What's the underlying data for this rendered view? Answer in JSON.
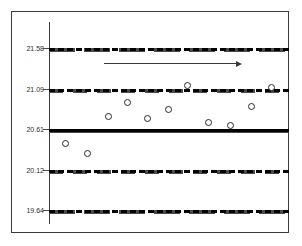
{
  "chart_data": {
    "type": "scatter",
    "title": "",
    "subtitle": "",
    "xlabel": "",
    "ylabel": "",
    "grid": false,
    "legend": null,
    "ylim": [
      19.64,
      21.58
    ],
    "ytick_labels": [
      "21.58",
      "21.09",
      "20.61",
      "20.12",
      "19.64"
    ],
    "ytick_values": [
      21.58,
      21.09,
      20.61,
      20.12,
      19.64
    ],
    "reference_lines": [
      {
        "name": "upper-control-limit",
        "value": 21.58,
        "style": "dash-long",
        "label": "21.58"
      },
      {
        "name": "upper-warning-limit",
        "value": 21.09,
        "style": "dash-short",
        "label": "21.09"
      },
      {
        "name": "center-line",
        "value": 20.61,
        "style": "solid",
        "label": "20.61"
      },
      {
        "name": "lower-warning-limit",
        "value": 20.12,
        "style": "dash-short",
        "label": "20.12"
      },
      {
        "name": "lower-control-limit",
        "value": 19.64,
        "style": "dash-long",
        "label": "19.64"
      }
    ],
    "x": [
      1,
      2,
      3,
      4,
      5,
      6,
      7,
      8,
      9,
      10,
      11
    ],
    "values": [
      20.44,
      20.32,
      20.77,
      20.94,
      20.74,
      20.85,
      21.14,
      20.69,
      20.65,
      20.89,
      21.11
    ],
    "points": [
      {
        "x": 1,
        "y": 20.44,
        "px": 64,
        "py": 142
      },
      {
        "x": 2,
        "y": 20.32,
        "px": 86,
        "py": 152
      },
      {
        "x": 3,
        "y": 20.77,
        "px": 107,
        "py": 115
      },
      {
        "x": 4,
        "y": 20.94,
        "px": 126,
        "py": 101
      },
      {
        "x": 5,
        "y": 20.74,
        "px": 146,
        "py": 117
      },
      {
        "x": 6,
        "y": 20.85,
        "px": 167,
        "py": 108
      },
      {
        "x": 7,
        "y": 21.14,
        "px": 186,
        "py": 84
      },
      {
        "x": 8,
        "y": 20.69,
        "px": 207,
        "py": 121
      },
      {
        "x": 9,
        "y": 20.65,
        "px": 229,
        "py": 124
      },
      {
        "x": 10,
        "y": 20.89,
        "px": 250,
        "py": 105
      },
      {
        "x": 11,
        "y": 21.11,
        "px": 270,
        "py": 86
      }
    ],
    "annotations": [
      {
        "name": "trend-arrow",
        "kind": "arrow",
        "direction": "right",
        "x_start_px": 103,
        "x_end_px": 241,
        "y_px": 62
      }
    ]
  }
}
